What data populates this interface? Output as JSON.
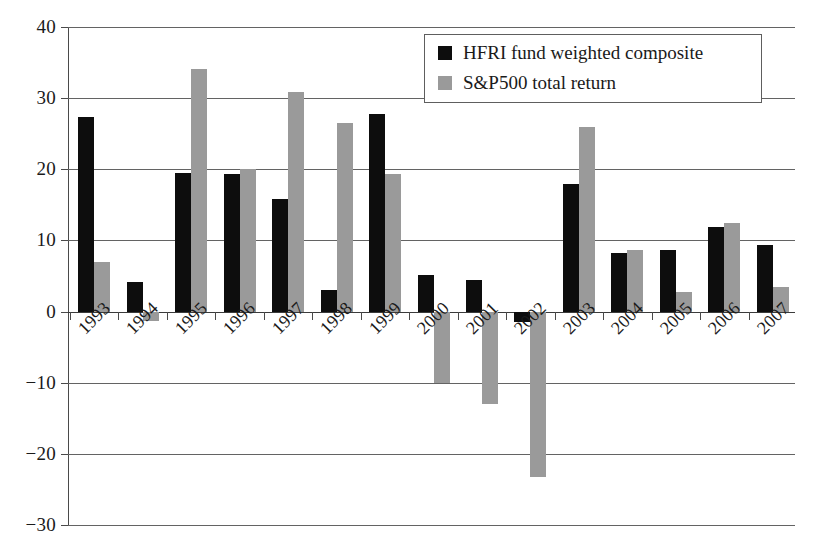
{
  "chart_data": {
    "type": "bar",
    "title": "",
    "subtitle": "",
    "xlabel": "",
    "ylabel": "",
    "ylim": [
      -30,
      40
    ],
    "ytick_step": 10,
    "yticks": [
      "40",
      "30",
      "20",
      "10",
      "0",
      "−10",
      "−20",
      "−30"
    ],
    "ytick_values": [
      40,
      30,
      20,
      10,
      0,
      -10,
      -20,
      -30
    ],
    "grid": true,
    "grid_axis": "y",
    "legend_position": "top-right",
    "categories": [
      "1993",
      "1994",
      "1995",
      "1996",
      "1997",
      "1998",
      "1999",
      "2000",
      "2001",
      "2002",
      "2003",
      "2004",
      "2005",
      "2006",
      "2007"
    ],
    "series": [
      {
        "name": "HFRI fund weighted composite",
        "color": "#0d0d0d",
        "values": [
          27.4,
          4.1,
          19.5,
          19.3,
          15.8,
          3.1,
          27.8,
          5.2,
          4.4,
          -1.5,
          17.9,
          8.3,
          8.7,
          11.9,
          9.4
        ]
      },
      {
        "name": "S&P500 total return",
        "color": "#9a9a9a",
        "values": [
          6.9,
          -1.3,
          34.1,
          20.0,
          30.9,
          26.5,
          19.4,
          -10.1,
          -13.0,
          -23.3,
          26.0,
          8.6,
          2.7,
          12.4,
          3.4
        ]
      }
    ]
  },
  "legend": {
    "items": [
      {
        "label": "HFRI fund weighted composite",
        "swatch": "series-a"
      },
      {
        "label": "S&P500 total return",
        "swatch": "series-b"
      }
    ]
  },
  "colors": {
    "series_a": "#0d0d0d",
    "series_b": "#9a9a9a",
    "axis": "#4a4a4a",
    "grid": "#636363",
    "background": "#ffffff"
  }
}
